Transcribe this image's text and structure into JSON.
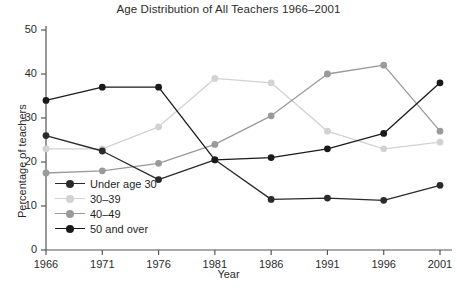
{
  "chart_data": {
    "type": "line",
    "title": "Age Distribution of All Teachers 1966–2001",
    "xlabel": "Year",
    "ylabel": "Percentage of teachers",
    "categories": [
      "1966",
      "1971",
      "1976",
      "1981",
      "1986",
      "1991",
      "1996",
      "2001"
    ],
    "x": [
      1966,
      1971,
      1976,
      1981,
      1986,
      1991,
      1996,
      2001
    ],
    "xlim": [
      1966,
      2001
    ],
    "ylim": [
      0,
      50
    ],
    "yticks": [
      "0",
      "10",
      "20",
      "30",
      "40",
      "50"
    ],
    "ytick_values": [
      0,
      10,
      20,
      30,
      40,
      50
    ],
    "grid": false,
    "legend_position": "inside-lower-left",
    "series": [
      {
        "name": "Under age 30",
        "color": "#2a2a2a",
        "values": [
          26.0,
          22.5,
          16.0,
          20.5,
          11.5,
          11.8,
          11.3,
          14.7
        ]
      },
      {
        "name": "30–39",
        "color": "#d2d2d2",
        "values": [
          23.0,
          23.0,
          28.0,
          39.0,
          38.0,
          27.0,
          23.0,
          24.5
        ]
      },
      {
        "name": "40–49",
        "color": "#9a9a9a",
        "values": [
          17.5,
          18.0,
          19.7,
          24.0,
          30.5,
          40.0,
          42.0,
          27.0
        ]
      },
      {
        "name": "50 and over",
        "color": "#1a1a1a",
        "values": [
          34.0,
          37.0,
          37.0,
          20.5,
          21.0,
          23.0,
          26.5,
          38.0
        ]
      }
    ]
  },
  "axes": {
    "tick_color": "#555555",
    "axis_color": "#555555"
  }
}
